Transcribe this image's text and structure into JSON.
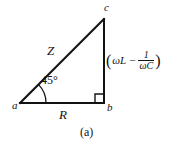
{
  "figure": {
    "caption": "(a)",
    "background_color": "#ffffff",
    "stroke_color": "#121212",
    "vertices": {
      "a": "a",
      "b": "b",
      "c": "c"
    },
    "sides": {
      "hypotenuse_label": "Z",
      "base_label": "R",
      "vertical_label": {
        "open_paren": "(",
        "omega_L": "ωL",
        "minus": "−",
        "fraction_numerator": "1",
        "fraction_denominator": "ωC",
        "close_paren": ")"
      }
    },
    "angle": {
      "value": "45°",
      "at_vertex": "a"
    },
    "right_angle": {
      "at_vertex": "b",
      "marker": "square"
    },
    "geometry": {
      "a_point": [
        20,
        103
      ],
      "b_point": [
        104,
        103
      ],
      "c_point": [
        104,
        19
      ],
      "arc_radius": 26
    }
  }
}
